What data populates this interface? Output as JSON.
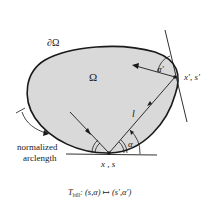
{
  "diagram": {
    "region_label": "Ω",
    "boundary_label": "∂Ω",
    "start_point_label": "x , s",
    "end_point_label": "x′, s′",
    "length_label": "l",
    "angle_label": "α",
    "angle_prime_label": "α′",
    "arclength_label_line1": "normalized",
    "arclength_label_line2": "arclength",
    "caption_T": "T",
    "caption_sub": "bill",
    "caption_rest": ": (s,α) ↦ (s′,α′)",
    "colors": {
      "fill": "#d9d9d9",
      "stroke": "#1a1a1a",
      "background": "#ffffff"
    }
  }
}
